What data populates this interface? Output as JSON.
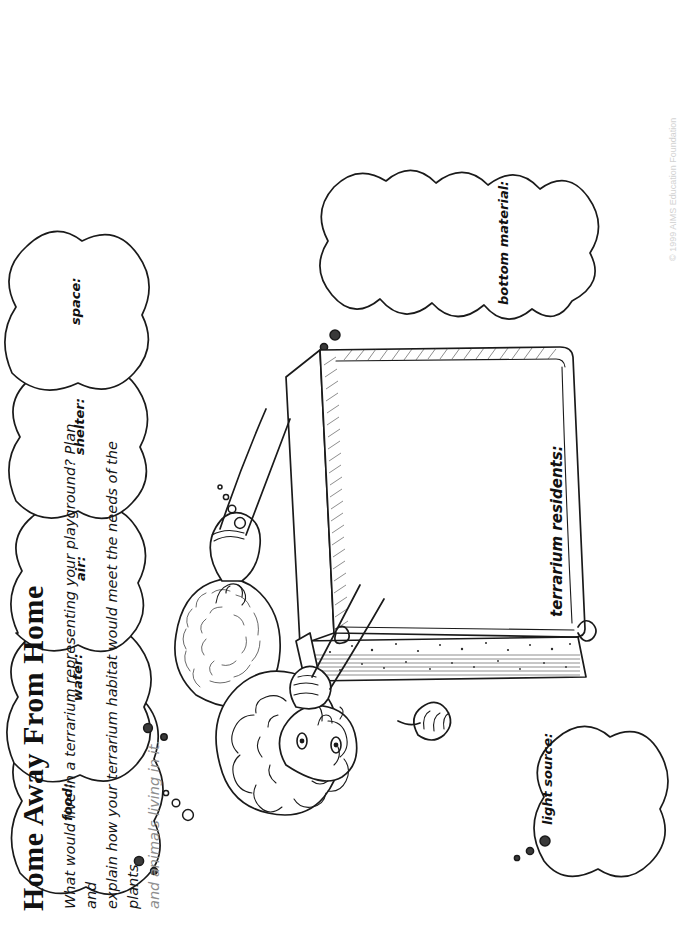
{
  "document": {
    "title": "Home Away From Home",
    "orientation": "landscape-rotated-90ccw",
    "instructions": {
      "line1": "What would live in a terrarium representing your playground? Plan and",
      "line2": "explain how your terrarium habitat would meet the needs of the plants",
      "line3": "and animals living in it."
    },
    "footer": "© 1999 AIMS Education Foundation"
  },
  "thought_bubbles": [
    {
      "id": "food",
      "label": "food:"
    },
    {
      "id": "water",
      "label": "water:"
    },
    {
      "id": "air",
      "label": "air:"
    },
    {
      "id": "shelter",
      "label": "shelter:"
    },
    {
      "id": "space",
      "label": "space:"
    },
    {
      "id": "light-source",
      "label": "light source:"
    },
    {
      "id": "bottom-material",
      "label": "bottom material:"
    }
  ],
  "terrarium": {
    "residents_label": "terrarium residents:"
  },
  "illustration": {
    "description": "two children leaning over an open terrarium tank",
    "figures": [
      "child-back-left",
      "child-front-right"
    ]
  },
  "colors": {
    "ink": "#1a1a1a",
    "paper": "#ffffff",
    "footer_text": "#d2d2d2"
  }
}
